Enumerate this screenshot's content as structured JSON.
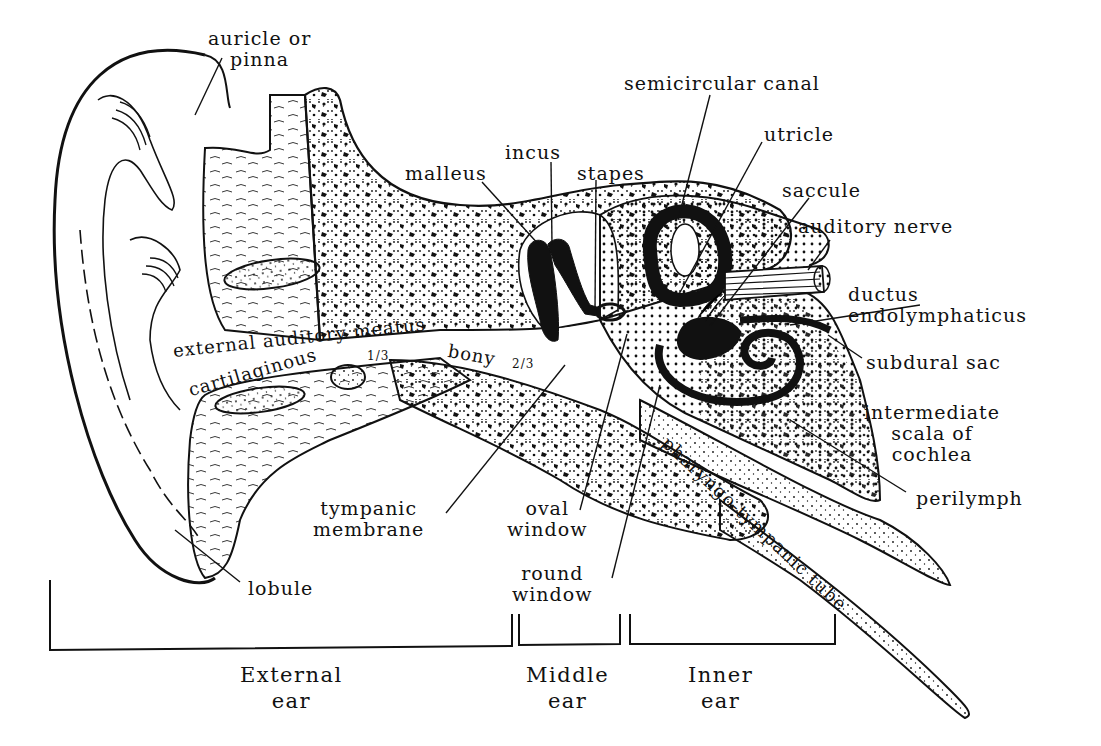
{
  "diagram": {
    "labels": {
      "auricle": "auricle or\npinna",
      "malleus": "malleus",
      "incus": "incus",
      "stapes": "stapes",
      "semicircular_canal": "semicircular canal",
      "utricle": "utricle",
      "saccule": "saccule",
      "auditory_nerve": "auditory nerve",
      "ductus_endolymphaticus": "ductus\nendolymphaticus",
      "subdural_sac": "subdural sac",
      "intermediate_scala": "intermediate\nscala of\ncochlea",
      "perilymph": "perilymph",
      "external_auditory_meatus": "external auditory meatus",
      "cartilaginous": "cartilaginous",
      "cartilaginous_fraction": "1/3",
      "bony": "bony",
      "bony_fraction": "2/3",
      "pharyngo_tympanic_tube": "pharyngo-tympanic tube",
      "tympanic_membrane": "tympanic\nmembrane",
      "oval_window": "oval\nwindow",
      "round_window": "round\nwindow",
      "lobule": "lobule"
    },
    "regions": [
      {
        "label": "External\near"
      },
      {
        "label": "Middle\near"
      },
      {
        "label": "Inner\near"
      }
    ],
    "colors": {
      "ink": "#111111",
      "paper": "#ffffff"
    }
  }
}
